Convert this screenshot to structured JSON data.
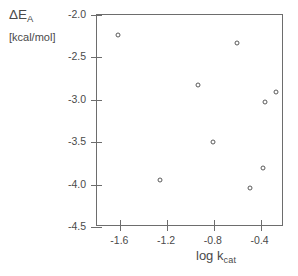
{
  "chart_data": {
    "type": "scatter",
    "title": "",
    "xlabel": "log k_cat",
    "xlabel_base": "log k",
    "xlabel_sub": "cat",
    "ylabel": "ΔE_A",
    "ylabel_base": "ΔE",
    "ylabel_sub": "A",
    "yunits": "[kcal/mol]",
    "xlim": [
      -1.8,
      -0.2
    ],
    "ylim": [
      -4.5,
      -2.0
    ],
    "xticks": [
      "-1.6",
      "-1.2",
      "-0.8",
      "-0.4"
    ],
    "xtick_values": [
      -1.6,
      -1.2,
      -0.8,
      -0.4
    ],
    "yticks": [
      "-2.0",
      "-2.5",
      "-3.0",
      "-3.5",
      "-4.0",
      "-4.5"
    ],
    "ytick_values": [
      -2.0,
      -2.5,
      -3.0,
      -3.5,
      -4.0,
      -4.5
    ],
    "grid": false,
    "legend": false,
    "marker": "open-circle",
    "marker_color": "#5a5a5a",
    "points": [
      {
        "x": -1.61,
        "y": -2.25
      },
      {
        "x": -0.59,
        "y": -2.34
      },
      {
        "x": -0.93,
        "y": -2.84
      },
      {
        "x": -0.26,
        "y": -2.92
      },
      {
        "x": -0.35,
        "y": -3.04
      },
      {
        "x": -0.8,
        "y": -3.51
      },
      {
        "x": -0.37,
        "y": -3.82
      },
      {
        "x": -1.25,
        "y": -3.96
      },
      {
        "x": -0.48,
        "y": -4.05
      }
    ]
  }
}
